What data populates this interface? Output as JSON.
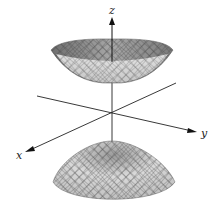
{
  "figure": {
    "axes": {
      "x_label": "x",
      "y_label": "y",
      "z_label": "z"
    },
    "surfaces": [
      {
        "name": "upper-sheet",
        "shape": "bowl opening upward"
      },
      {
        "name": "lower-sheet",
        "shape": "dome opening downward"
      }
    ],
    "colors": {
      "axis": "#222222",
      "surface_fill_light": "#e8e8e8",
      "surface_fill_dark": "#8a8a8a",
      "mesh": "#555555"
    }
  }
}
